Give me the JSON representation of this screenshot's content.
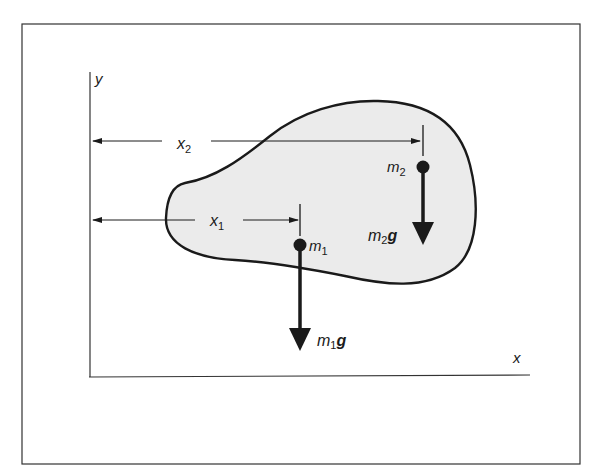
{
  "figure": {
    "axes": {
      "x_label": "x",
      "y_label": "y"
    },
    "distances": [
      {
        "name": "x",
        "sub": "2",
        "target": "m2"
      },
      {
        "name": "x",
        "sub": "1",
        "target": "m1"
      }
    ],
    "masses": [
      {
        "name": "m",
        "sub": "1",
        "force_name": "m",
        "force_sub": "1",
        "force_vec": "g"
      },
      {
        "name": "m",
        "sub": "2",
        "force_name": "m",
        "force_sub": "2",
        "force_vec": "g"
      }
    ],
    "colors": {
      "ink": "#1a1a1a",
      "body_fill": "#ebebeb",
      "frame": "#333333",
      "background": "#ffffff"
    }
  }
}
